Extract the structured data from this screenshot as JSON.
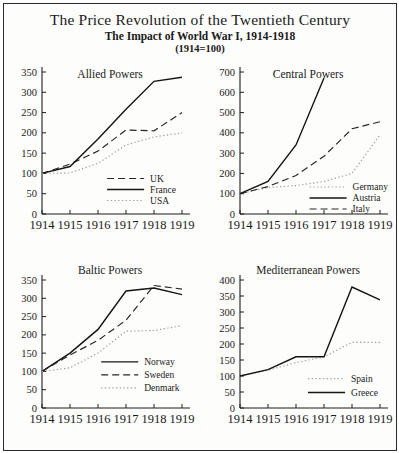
{
  "header": {
    "title": "The Price Revolution of the Twentieth Century",
    "subtitle": "The Impact of World War I, 1914-1918",
    "note": "(1914=100)"
  },
  "chart_data": [
    {
      "type": "line",
      "title": "Allied Powers",
      "x": [
        "1914",
        "1915",
        "1916",
        "1917",
        "1918",
        "1919"
      ],
      "ylim": [
        0,
        350
      ],
      "ytick_step": 50,
      "grid": "off",
      "legend_position": "inside-lower-center",
      "legend": {
        "x": 0.44,
        "y": 0.75
      },
      "series": [
        {
          "name": "UK",
          "style": "dashed",
          "values": [
            100,
            123,
            155,
            207,
            205,
            250
          ]
        },
        {
          "name": "France",
          "style": "solid",
          "values": [
            100,
            117,
            185,
            258,
            327,
            337
          ]
        },
        {
          "name": "USA",
          "style": "dotted",
          "values": [
            100,
            101,
            125,
            170,
            190,
            200
          ]
        }
      ]
    },
    {
      "type": "line",
      "title": "Central Powers",
      "x": [
        "1914",
        "1915",
        "1916",
        "1917",
        "1918",
        "1919"
      ],
      "ylim": [
        0,
        700
      ],
      "ytick_step": 100,
      "grid": "off",
      "legend_position": "inside-lower-right",
      "legend": {
        "x": 0.47,
        "y": 0.81
      },
      "series": [
        {
          "name": "Germany",
          "style": "dotted",
          "values": [
            100,
            130,
            140,
            160,
            200,
            390
          ]
        },
        {
          "name": "Austria",
          "style": "solid",
          "values": [
            100,
            160,
            340,
            670,
            null,
            null
          ]
        },
        {
          "name": "Italy",
          "style": "dashed",
          "values": [
            100,
            135,
            190,
            285,
            420,
            455
          ]
        }
      ]
    },
    {
      "type": "line",
      "title": "Baltic Powers",
      "x": [
        "1914",
        "1915",
        "1916",
        "1917",
        "1918",
        "1919"
      ],
      "ylim": [
        0,
        350
      ],
      "ytick_step": 50,
      "grid": "off",
      "legend_position": "inside-lower-center",
      "legend": {
        "x": 0.4,
        "y": 0.64
      },
      "series": [
        {
          "name": "Norway",
          "style": "solid",
          "values": [
            100,
            150,
            215,
            320,
            328,
            310
          ]
        },
        {
          "name": "Sweden",
          "style": "dashed",
          "values": [
            100,
            145,
            185,
            240,
            335,
            325
          ]
        },
        {
          "name": "Denmark",
          "style": "dotted",
          "values": [
            100,
            110,
            150,
            210,
            212,
            225
          ]
        }
      ]
    },
    {
      "type": "line",
      "title": "Mediterranean Powers",
      "x": [
        "1914",
        "1915",
        "1916",
        "1917",
        "1918",
        "1919"
      ],
      "ylim": [
        0,
        400
      ],
      "ytick_step": 50,
      "grid": "off",
      "legend_position": "inside-lower-right",
      "legend": {
        "x": 0.46,
        "y": 0.77
      },
      "series": [
        {
          "name": "Spain",
          "style": "dotted",
          "values": [
            100,
            118,
            142,
            160,
            205,
            205
          ]
        },
        {
          "name": "Greece",
          "style": "solid",
          "values": [
            100,
            120,
            160,
            160,
            378,
            338
          ]
        }
      ]
    }
  ]
}
